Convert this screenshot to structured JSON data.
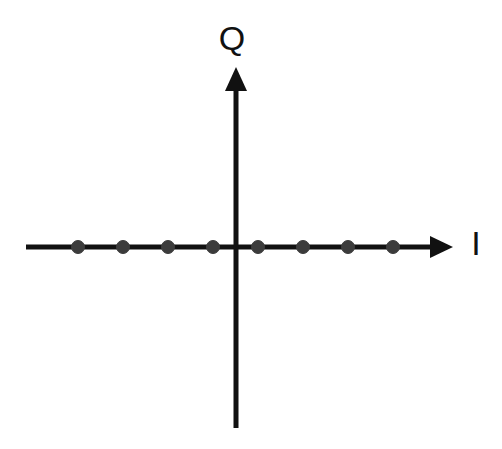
{
  "figure": {
    "width": 502,
    "height": 449,
    "background_color": "#ffffff",
    "title": ""
  },
  "axes": {
    "horizontal": {
      "label": "I",
      "label_name": "in-phase-axis-label",
      "color": "#111111",
      "line_width": 5,
      "x_start": 26,
      "x_end": 453,
      "y": 247,
      "arrow": "right"
    },
    "vertical": {
      "label": "Q",
      "label_name": "quadrature-axis-label",
      "color": "#111111",
      "line_width": 5,
      "x": 236,
      "y_start": 428,
      "y_end": 67,
      "arrow": "up"
    },
    "origin": {
      "x": 236,
      "y": 247
    }
  },
  "labels": {
    "q": {
      "text": "Q",
      "x": 232,
      "y": 50,
      "font_size": 34
    },
    "i": {
      "text": "I",
      "x": 476,
      "y": 255,
      "font_size": 34
    }
  },
  "chart_data": {
    "type": "scatter",
    "title": "",
    "subtitle": "",
    "xlabel": "I",
    "ylabel": "Q",
    "xlim": [
      -4.5,
      4.5
    ],
    "ylim": [
      -4.5,
      4.5
    ],
    "grid": false,
    "legend": null,
    "tick_labels": {
      "x": [],
      "y": []
    },
    "marker": {
      "shape": "circle",
      "color": "#3c3c3c",
      "diameter_px": 13,
      "edge_color": "#3c3c3c"
    },
    "series": [
      {
        "name": "8-ASK constellation points",
        "x": [
          -3.5,
          -2.5,
          -1.5,
          -0.5,
          0.5,
          1.5,
          2.5,
          3.5
        ],
        "y": [
          0,
          0,
          0,
          0,
          0,
          0,
          0,
          0
        ]
      }
    ],
    "points_px": [
      {
        "cx": 78,
        "cy": 247,
        "name": "constellation-point-1"
      },
      {
        "cx": 123,
        "cy": 247,
        "name": "constellation-point-2"
      },
      {
        "cx": 168,
        "cy": 247,
        "name": "constellation-point-3"
      },
      {
        "cx": 213,
        "cy": 247,
        "name": "constellation-point-4"
      },
      {
        "cx": 258,
        "cy": 247,
        "name": "constellation-point-5"
      },
      {
        "cx": 303,
        "cy": 247,
        "name": "constellation-point-6"
      },
      {
        "cx": 348,
        "cy": 247,
        "name": "constellation-point-7"
      },
      {
        "cx": 393,
        "cy": 247,
        "name": "constellation-point-8"
      }
    ],
    "annotations": []
  },
  "colors": {
    "axis": "#111111",
    "marker": "#3c3c3c",
    "background": "#ffffff",
    "text": "#111111"
  }
}
